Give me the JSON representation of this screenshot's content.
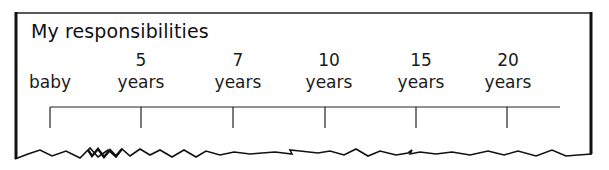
{
  "title": "My responsibilities",
  "timeline": {
    "points": [
      {
        "number": "",
        "unit": "baby",
        "x": 50
      },
      {
        "number": "5",
        "unit": "years",
        "x": 141
      },
      {
        "number": "7",
        "unit": "years",
        "x": 233
      },
      {
        "number": "10",
        "unit": "years",
        "x": 325
      },
      {
        "number": "15",
        "unit": "years",
        "x": 416
      },
      {
        "number": "20",
        "unit": "years",
        "x": 507
      }
    ]
  },
  "colors": {
    "ink": "#111111",
    "background": "#ffffff"
  }
}
